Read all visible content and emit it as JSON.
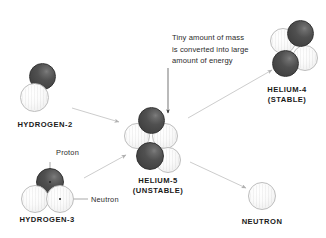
{
  "diagram": {
    "title_text_present": false,
    "background": "#ffffff",
    "colors": {
      "proton": "#4a4a4a",
      "neutron": "#f4f4f4",
      "neutron_outline": "#bdbdbd",
      "arrow": "#b9b9b9",
      "pointer_arrow": "#3a3a3a",
      "callout_line": "#6e6e6e",
      "label_text": "#1a1a1a",
      "note_text": "#2b2b2b"
    },
    "nuclei": [
      {
        "id": "hydrogen-2",
        "caption": "HYDROGEN-2",
        "caption_line2": "",
        "protons": 1,
        "neutrons": 1
      },
      {
        "id": "hydrogen-3",
        "caption": "HYDROGEN-3",
        "caption_line2": "",
        "protons": 1,
        "neutrons": 2
      },
      {
        "id": "helium-5",
        "caption": "HELIUM-5",
        "caption_line2": "(UNSTABLE)",
        "protons": 2,
        "neutrons": 3
      },
      {
        "id": "helium-4",
        "caption": "HELIUM-4",
        "caption_line2": "(STABLE)",
        "protons": 2,
        "neutrons": 2
      },
      {
        "id": "neutron-product",
        "caption": "NEUTRON",
        "caption_line2": "",
        "protons": 0,
        "neutrons": 1
      }
    ],
    "callouts": [
      {
        "id": "proton",
        "label": "Proton"
      },
      {
        "id": "neutron",
        "label": "Neutron"
      }
    ],
    "annotation": {
      "id": "energy-note",
      "text": "Tiny amount of mass\nis converted into large\namount of energy"
    }
  }
}
